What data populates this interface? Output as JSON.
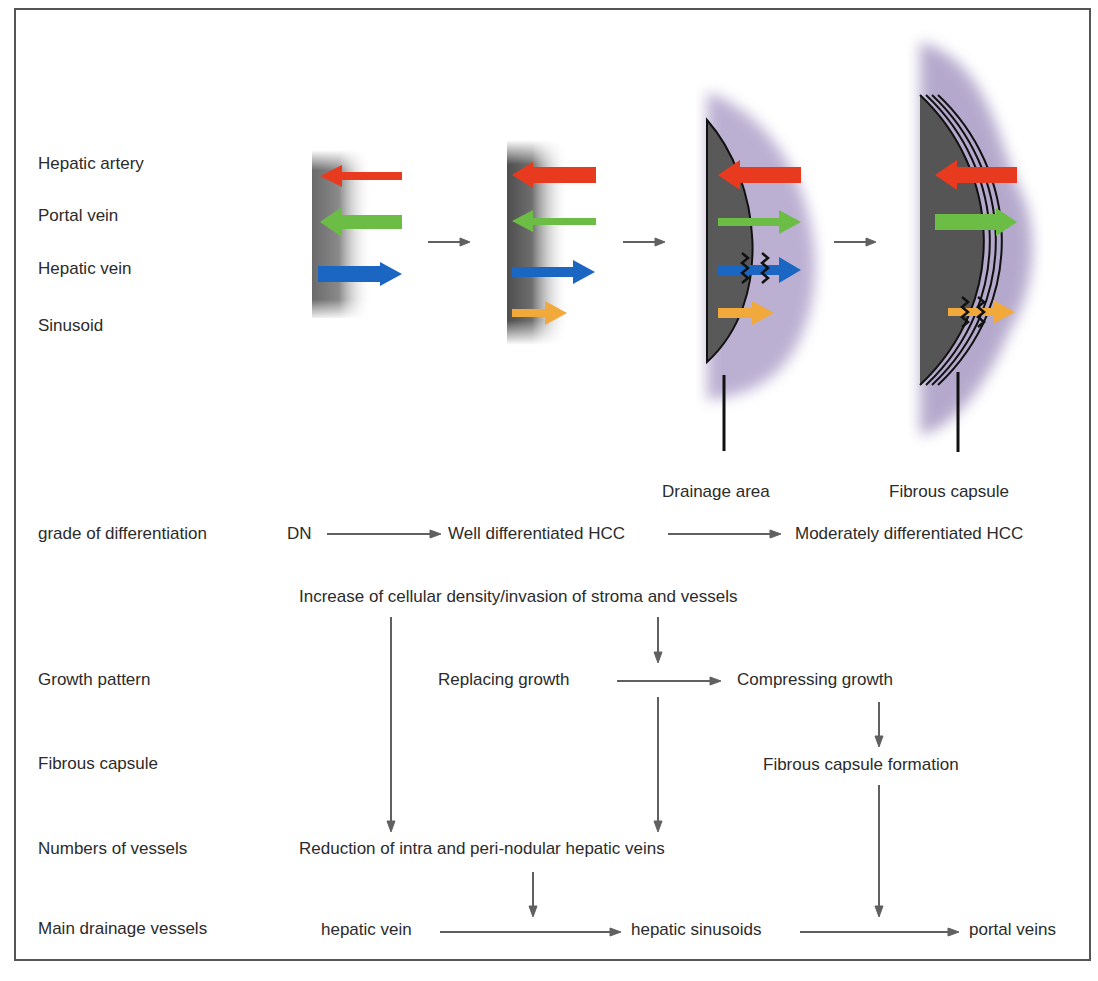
{
  "figure": {
    "vessel_legend": [
      {
        "label": "Hepatic artery",
        "color": "#e83a1f"
      },
      {
        "label": "Portal vein",
        "color": "#6cbd45"
      },
      {
        "label": "Hepatic vein",
        "color": "#1a66c2"
      },
      {
        "label": "Sinusoid",
        "color": "#f2a93b"
      }
    ],
    "stage_labels": {
      "drainage_area": "Drainage area",
      "fibrous_capsule": "Fibrous capsule"
    },
    "colors": {
      "nodule": "#5a5a5a",
      "halo": "#b3a6cc",
      "flow_arrow": "#606060",
      "frame": "#555555"
    }
  },
  "flowchart": {
    "row_labels": {
      "grade": "grade of differentiation",
      "growth": "Growth pattern",
      "capsule": "Fibrous capsule",
      "vessels": "Numbers of vessels",
      "drainage": "Main drainage vessels"
    },
    "grade": {
      "dn": "DN",
      "well": "Well differentiated HCC",
      "moderate": "Moderately differentiated HCC"
    },
    "increase_note": "Increase of cellular density/invasion of stroma and vessels",
    "growth": {
      "replacing": "Replacing growth",
      "compressing": "Compressing growth"
    },
    "capsule_formation": "Fibrous capsule formation",
    "reduction_note": "Reduction of intra and peri-nodular hepatic veins",
    "drainage": {
      "hepatic_vein": "hepatic vein",
      "sinusoids": "hepatic sinusoids",
      "portal": "portal veins"
    }
  }
}
